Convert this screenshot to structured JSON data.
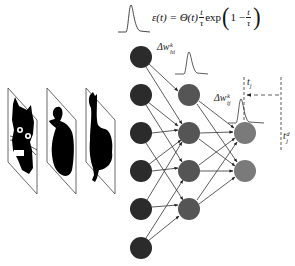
{
  "formula": {
    "lhs": "ε(t) = Θ(t)",
    "frac1_num": "t",
    "frac1_den": "τ",
    "exp": "exp",
    "one_minus": "1 − ",
    "frac2_num": "t",
    "frac2_den": "τ",
    "paren_open": "(",
    "paren_close": ")"
  },
  "labels": {
    "delta_w_hi": {
      "base": "Δw",
      "sup": "k",
      "sub": "hi"
    },
    "delta_w_ij": {
      "base": "Δw",
      "sup": "k",
      "sub": "ij"
    },
    "t_j": {
      "base": "t",
      "sub": "j"
    },
    "t_j_d": {
      "base": "t",
      "sup": "d",
      "sub": "j"
    }
  },
  "input_images": [
    {
      "name": "cat"
    },
    {
      "name": "duck"
    },
    {
      "name": "rooster"
    }
  ],
  "network": {
    "input_layer": {
      "count": 6,
      "color": "#2b2b2b"
    },
    "hidden_layer": {
      "count": 4,
      "color": "#555555"
    },
    "output_layer": {
      "count": 2,
      "color": "#7a7a7a"
    },
    "input_to_hidden": [
      [
        1,
        1
      ],
      [
        1,
        2
      ],
      [
        2,
        2
      ],
      [
        2,
        3
      ],
      [
        3,
        2
      ],
      [
        3,
        4
      ],
      [
        4,
        2
      ],
      [
        4,
        3
      ],
      [
        5,
        3
      ],
      [
        5,
        4
      ],
      [
        6,
        3
      ],
      [
        6,
        4
      ]
    ],
    "hidden_to_output": [
      [
        1,
        1
      ],
      [
        1,
        2
      ],
      [
        2,
        1
      ],
      [
        2,
        2
      ],
      [
        3,
        1
      ],
      [
        3,
        2
      ],
      [
        4,
        1
      ],
      [
        4,
        2
      ]
    ]
  }
}
